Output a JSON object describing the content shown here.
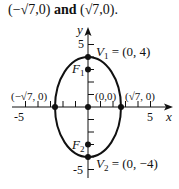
{
  "caption": {
    "left_point": "(−√7,0)",
    "connector": "and",
    "right_point": "(√7,0)",
    "end": "."
  },
  "diagram": {
    "type": "ellipse-graph",
    "axes": {
      "x_label": "x",
      "y_label": "y",
      "x_ticks": [
        "-5",
        "5"
      ],
      "y_ticks": [
        "5",
        "-5"
      ]
    },
    "points": {
      "V1": {
        "label_name": "V",
        "label_sub": "1",
        "label_value": " = (0, 4)"
      },
      "V2": {
        "label_name": "V",
        "label_sub": "2",
        "label_value": " = (0, −4)"
      },
      "F1": {
        "label_name": "F",
        "label_sub": "1"
      },
      "F2": {
        "label_name": "F",
        "label_sub": "2"
      },
      "origin": {
        "label": "(0,0)"
      },
      "left_vertex": {
        "label": "(−√7, 0)"
      },
      "right_vertex": {
        "label": "(√7, 0)"
      }
    },
    "equation_params": {
      "a_squared": 7,
      "b_squared": 16,
      "c": 3
    },
    "colors": {
      "stroke": "#111111",
      "background": "#ffffff"
    }
  }
}
